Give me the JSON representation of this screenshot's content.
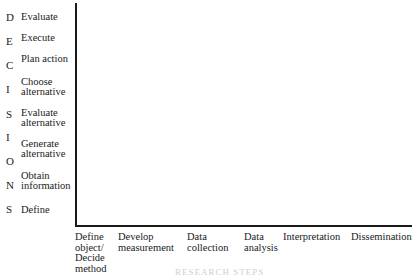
{
  "vertical_word": [
    "D",
    "E",
    "C",
    "I",
    "S",
    "I",
    "O",
    "N",
    "S"
  ],
  "y_axis_steps": [
    "Evaluate",
    "Execute",
    "Plan action",
    "Choose\nalternative",
    "Evaluate\nalternative",
    "Generate\nalternative",
    "Obtain\ninformation",
    "Define"
  ],
  "x_axis_steps": [
    "Define\nobject/\nDecide\nmethod",
    "Develop\nmeasurement",
    "Data\ncollection",
    "Data\nanalysis",
    "Interpretation",
    "Dissemination"
  ],
  "x_axis_title": "RESEARCH STEPS"
}
